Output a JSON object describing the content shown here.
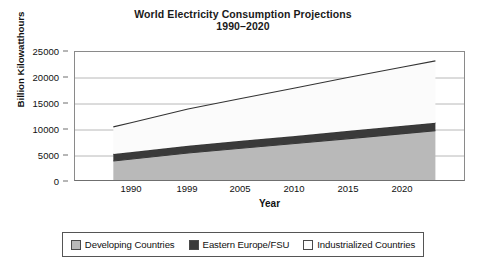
{
  "chart_data": {
    "type": "area",
    "stacked": true,
    "title": "World Electricity Consumption Projections",
    "subtitle": "1990–2020",
    "xlabel": "Year",
    "ylabel": "Billion Kilowatthours",
    "grid": true,
    "legend_position": "bottom",
    "ylim": [
      0,
      25000
    ],
    "yticks": [
      0,
      5000,
      10000,
      15000,
      20000,
      25000
    ],
    "ytick_labels": [
      "0",
      "5000",
      "10000",
      "15000",
      "20000",
      "25000"
    ],
    "xlim": [
      1987,
      2023
    ],
    "xticks": [
      1990,
      1999,
      2005,
      2010,
      2015,
      2020
    ],
    "xtick_labels": [
      "1990",
      "1999",
      "2005",
      "2010",
      "2015",
      "2020"
    ],
    "x": [
      1987,
      1990,
      1999,
      2005,
      2010,
      2015,
      2020,
      2023
    ],
    "series": [
      {
        "name": "Developing Countries",
        "color": "#b9b9b9",
        "values": [
          4050,
          4430,
          5580,
          6480,
          7400,
          8350,
          9300,
          9850
        ]
      },
      {
        "name": "Eastern Europe/FSU",
        "color": "#3a3a3a",
        "values": [
          1340,
          1360,
          1400,
          1440,
          1470,
          1500,
          1530,
          1550
        ]
      },
      {
        "name": "Industrialized Countries",
        "color": "#fbfbfb",
        "values": [
          5210,
          5660,
          7050,
          8140,
          9200,
          10300,
          11300,
          11900
        ]
      }
    ],
    "cumulative_totals": [
      10600,
      11450,
      14030,
      16060,
      18070,
      20150,
      22130,
      23300
    ]
  },
  "legend": {
    "items": [
      {
        "label": "Developing Countries",
        "swatch": "#b9b9b9"
      },
      {
        "label": "Eastern Europe/FSU",
        "swatch": "#3a3a3a"
      },
      {
        "label": "Industrialized Countries",
        "swatch": "#fdfdfd"
      }
    ]
  },
  "colors": {
    "developing": "#b9b9b9",
    "eastern_europe": "#3a3a3a",
    "industrialized": "#fbfbfb",
    "axis": "#6f6f6f",
    "gridline": "#b0b0b0",
    "text": "#111111",
    "background": "#ffffff"
  }
}
